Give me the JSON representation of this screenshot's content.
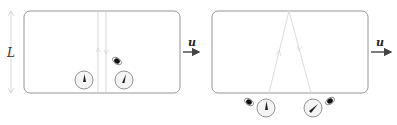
{
  "figure": {
    "left_panel": {
      "height_label": "L",
      "velocity_label": "u",
      "description": "Rigid box moving with velocity u; light ray travels vertically between floor and ceiling; two clocks at bottom"
    },
    "right_panel": {
      "velocity_label": "u",
      "description": "Same box viewed from stationary frame; light path forms inverted V; clocks shown outside below the box"
    },
    "colors": {
      "box_stroke": "#888888",
      "light_path": "#d8d8d8",
      "arrow": "#444444",
      "clock_face": "#f2f2f2",
      "clock_stroke": "#777777",
      "hand": "#222222"
    }
  }
}
